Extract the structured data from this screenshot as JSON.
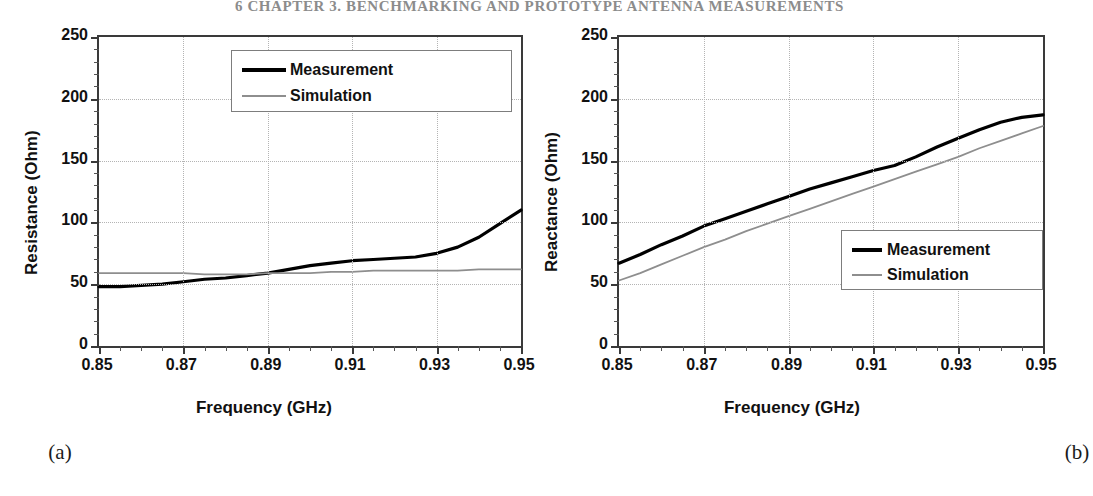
{
  "page_header": "6    CHAPTER 3.  BENCHMARKING AND PROTOTYPE ANTENNA MEASUREMENTS",
  "figure": {
    "panels": [
      {
        "caption": "(a)",
        "legend": {
          "entries": [
            {
              "label": "Measurement",
              "style": "measurement",
              "color": "#000000"
            },
            {
              "label": "Simulation",
              "style": "simulation",
              "color": "#8e8e8e"
            }
          ]
        },
        "chart_data": {
          "type": "line",
          "title": "",
          "xlabel": "Frequency (GHz)",
          "ylabel": "Resistance (Ohm)",
          "xlim": [
            0.85,
            0.95
          ],
          "ylim": [
            0,
            250
          ],
          "xticks": [
            "0.85",
            "0.87",
            "0.89",
            "0.91",
            "0.93",
            "0.95"
          ],
          "xtick_values": [
            0.85,
            0.87,
            0.89,
            0.91,
            0.93,
            0.95
          ],
          "xtick_minor_step": 0.005,
          "yticks": [
            "0",
            "50",
            "100",
            "150",
            "200",
            "250"
          ],
          "ytick_values": [
            0,
            50,
            100,
            150,
            200,
            250
          ],
          "ytick_minor_step": 10,
          "grid": true,
          "grid_axes": "both",
          "legend_position": "top-right",
          "x": [
            0.85,
            0.855,
            0.86,
            0.865,
            0.87,
            0.875,
            0.88,
            0.885,
            0.89,
            0.895,
            0.9,
            0.905,
            0.91,
            0.915,
            0.92,
            0.925,
            0.93,
            0.935,
            0.94,
            0.945,
            0.95
          ],
          "series": [
            {
              "name": "Measurement",
              "color": "#000000",
              "width": 3.2,
              "values": [
                48,
                48,
                49,
                50,
                52,
                54,
                55,
                57,
                59,
                62,
                65,
                67,
                69,
                70,
                71,
                72,
                75,
                80,
                88,
                99,
                110
              ]
            },
            {
              "name": "Simulation",
              "color": "#8e8e8e",
              "width": 1.8,
              "values": [
                59,
                59,
                59,
                59,
                59,
                58,
                58,
                58,
                59,
                59,
                59,
                60,
                60,
                61,
                61,
                61,
                61,
                61,
                62,
                62,
                62
              ]
            }
          ]
        }
      },
      {
        "caption": "(b)",
        "legend": {
          "entries": [
            {
              "label": "Measurement",
              "style": "measurement",
              "color": "#000000"
            },
            {
              "label": "Simulation",
              "style": "simulation",
              "color": "#8e8e8e"
            }
          ]
        },
        "chart_data": {
          "type": "line",
          "title": "",
          "xlabel": "Frequency (GHz)",
          "ylabel": "Reactance (Ohm)",
          "xlim": [
            0.85,
            0.95
          ],
          "ylim": [
            0,
            250
          ],
          "xticks": [
            "0.85",
            "0.87",
            "0.89",
            "0.91",
            "0.93",
            "0.95"
          ],
          "xtick_values": [
            0.85,
            0.87,
            0.89,
            0.91,
            0.93,
            0.95
          ],
          "xtick_minor_step": 0.005,
          "yticks": [
            "0",
            "50",
            "100",
            "150",
            "200",
            "250"
          ],
          "ytick_values": [
            0,
            50,
            100,
            150,
            200,
            250
          ],
          "ytick_minor_step": 10,
          "grid": true,
          "grid_axes": "both",
          "legend_position": "bottom-right",
          "x": [
            0.85,
            0.855,
            0.86,
            0.865,
            0.87,
            0.875,
            0.88,
            0.885,
            0.89,
            0.895,
            0.9,
            0.905,
            0.91,
            0.915,
            0.92,
            0.925,
            0.93,
            0.935,
            0.94,
            0.945,
            0.95
          ],
          "series": [
            {
              "name": "Measurement",
              "color": "#000000",
              "width": 3.2,
              "values": [
                67,
                74,
                82,
                89,
                97,
                103,
                109,
                115,
                121,
                127,
                132,
                137,
                142,
                146,
                153,
                161,
                168,
                175,
                181,
                185,
                187
              ]
            },
            {
              "name": "Simulation",
              "color": "#8e8e8e",
              "width": 1.8,
              "values": [
                53,
                59,
                66,
                73,
                80,
                86,
                93,
                99,
                105,
                111,
                117,
                123,
                129,
                135,
                141,
                147,
                153,
                160,
                166,
                172,
                178
              ]
            }
          ]
        }
      }
    ]
  }
}
